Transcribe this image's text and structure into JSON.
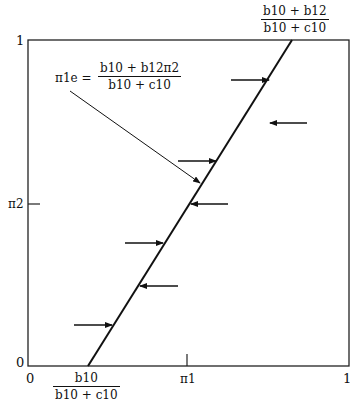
{
  "diagram": {
    "type": "best-response line diagram",
    "y_axis": {
      "label": "π2",
      "tick_top": "1",
      "tick_bottom": "0"
    },
    "x_axis": {
      "label": "π1",
      "tick_left": "0",
      "tick_right": "1"
    },
    "top_intercept": {
      "numerator": "b10 + b12",
      "denominator": "b10 + c10"
    },
    "bottom_intercept": {
      "numerator": "b10",
      "denominator": "b10 + c10"
    },
    "equation": {
      "lhs": "π1e =",
      "numerator": "b10 + b12π2",
      "denominator": "b10 + c10"
    },
    "arrows": [
      {
        "side": "left",
        "direction": "right",
        "y_fraction": 0.88
      },
      {
        "side": "right",
        "direction": "left",
        "y_fraction": 0.75
      },
      {
        "side": "left",
        "direction": "right",
        "y_fraction": 0.63
      },
      {
        "side": "right",
        "direction": "left",
        "y_fraction": 0.5
      },
      {
        "side": "left",
        "direction": "right",
        "y_fraction": 0.38
      },
      {
        "side": "right",
        "direction": "left",
        "y_fraction": 0.25
      },
      {
        "side": "left",
        "direction": "right",
        "y_fraction": 0.13
      }
    ]
  }
}
